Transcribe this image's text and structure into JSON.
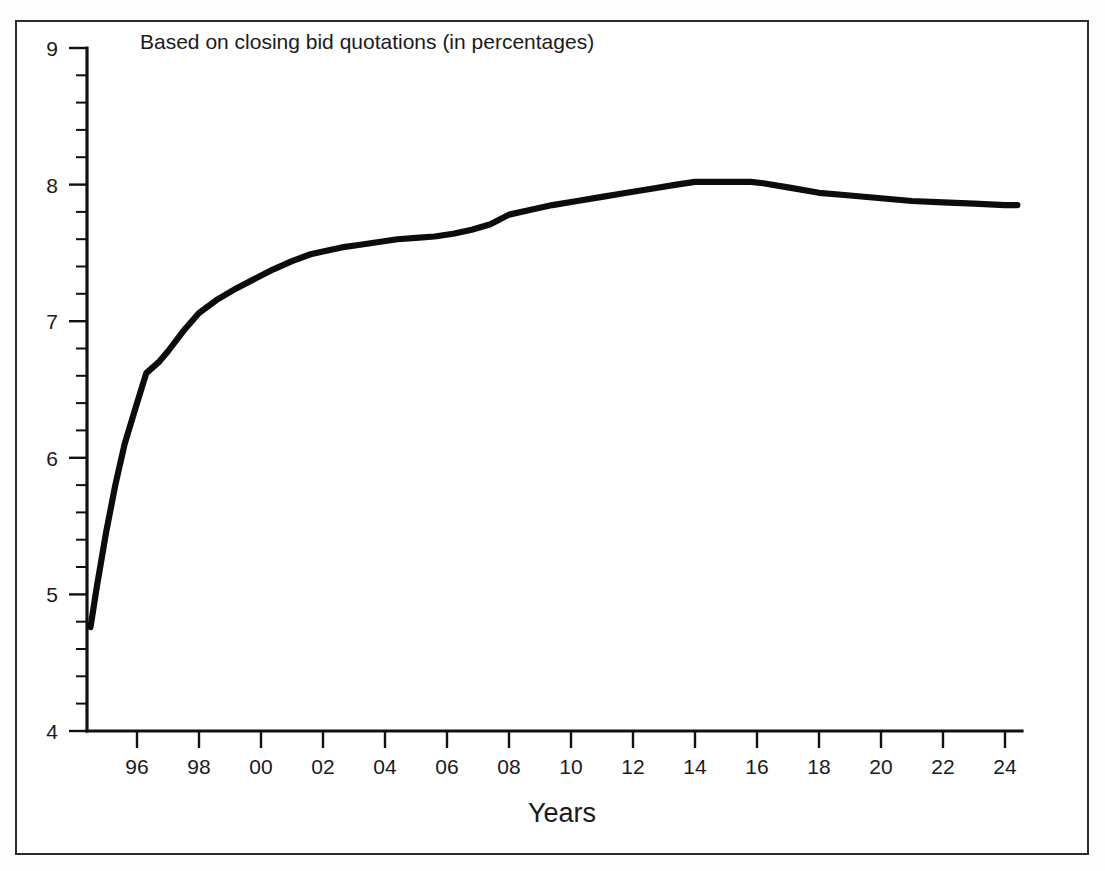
{
  "figure": {
    "title": "Based on closing bid quotations (in percentages)",
    "xlabel": "Years"
  },
  "chart_data": {
    "type": "line",
    "title": "Based on closing bid quotations (in percentages)",
    "subtitle": "",
    "xlabel": "Years",
    "ylabel": "",
    "grid": false,
    "legend": null,
    "xlim": [
      1994.5,
      2024.4
    ],
    "ylim": [
      4,
      9
    ],
    "y_major_ticks": [
      4,
      5,
      6,
      7,
      8,
      9
    ],
    "y_minor_tick_step": 0.2,
    "y_tick_labels": [
      "4",
      "5",
      "6",
      "7",
      "8",
      "9"
    ],
    "x_major_ticks": [
      1996,
      1998,
      2000,
      2002,
      2004,
      2006,
      2008,
      2010,
      2012,
      2014,
      2016,
      2018,
      2020,
      2022,
      2024
    ],
    "x_tick_labels": [
      "96",
      "98",
      "00",
      "02",
      "04",
      "06",
      "08",
      "10",
      "12",
      "14",
      "16",
      "18",
      "20",
      "22",
      "24"
    ],
    "series": [
      {
        "name": "Closing bid quotations",
        "color": "#0c0c0c",
        "x": [
          1994.5,
          1994.7,
          1995.0,
          1995.3,
          1995.6,
          1996.0,
          1996.3,
          1996.7,
          1997.0,
          1997.5,
          1998.0,
          1998.6,
          1999.2,
          1999.8,
          2000.4,
          2001.0,
          2001.6,
          2002.0,
          2002.6,
          2003.2,
          2003.8,
          2004.4,
          2005.0,
          2005.6,
          2006.2,
          2006.8,
          2007.4,
          2008.0,
          2008.6,
          2009.4,
          2010.2,
          2011.0,
          2011.8,
          2012.6,
          2013.4,
          2014.0,
          2014.6,
          2015.2,
          2015.8,
          2016.2,
          2017.0,
          2018.0,
          2019.0,
          2020.0,
          2021.0,
          2022.0,
          2023.0,
          2024.0,
          2024.4
        ],
        "y": [
          4.76,
          5.05,
          5.45,
          5.8,
          6.1,
          6.4,
          6.62,
          6.7,
          6.78,
          6.93,
          7.06,
          7.16,
          7.24,
          7.31,
          7.38,
          7.44,
          7.49,
          7.51,
          7.54,
          7.56,
          7.58,
          7.6,
          7.61,
          7.62,
          7.64,
          7.67,
          7.71,
          7.78,
          7.81,
          7.85,
          7.88,
          7.91,
          7.94,
          7.97,
          8.0,
          8.02,
          8.02,
          8.02,
          8.02,
          8.01,
          7.98,
          7.94,
          7.92,
          7.9,
          7.88,
          7.87,
          7.86,
          7.85,
          7.85
        ]
      }
    ],
    "annotations": []
  },
  "axes": {
    "y_ticks": [
      {
        "value": 9,
        "label": "9"
      },
      {
        "value": 8,
        "label": "8"
      },
      {
        "value": 7,
        "label": "7"
      },
      {
        "value": 6,
        "label": "6"
      },
      {
        "value": 5,
        "label": "5"
      },
      {
        "value": 4,
        "label": "4"
      }
    ],
    "x_ticks": [
      {
        "value": 1996,
        "label": "96"
      },
      {
        "value": 1998,
        "label": "98"
      },
      {
        "value": 2000,
        "label": "00"
      },
      {
        "value": 2002,
        "label": "02"
      },
      {
        "value": 2004,
        "label": "04"
      },
      {
        "value": 2006,
        "label": "06"
      },
      {
        "value": 2008,
        "label": "08"
      },
      {
        "value": 2010,
        "label": "10"
      },
      {
        "value": 2012,
        "label": "12"
      },
      {
        "value": 2014,
        "label": "14"
      },
      {
        "value": 2016,
        "label": "16"
      },
      {
        "value": 2018,
        "label": "18"
      },
      {
        "value": 2020,
        "label": "20"
      },
      {
        "value": 2022,
        "label": "22"
      },
      {
        "value": 2024,
        "label": "24"
      }
    ]
  },
  "colors": {
    "series": "#0c0c0c",
    "axis": "#111111",
    "frame": "#2c2c2c",
    "text": "#1a1a1a",
    "background": "#ffffff"
  }
}
